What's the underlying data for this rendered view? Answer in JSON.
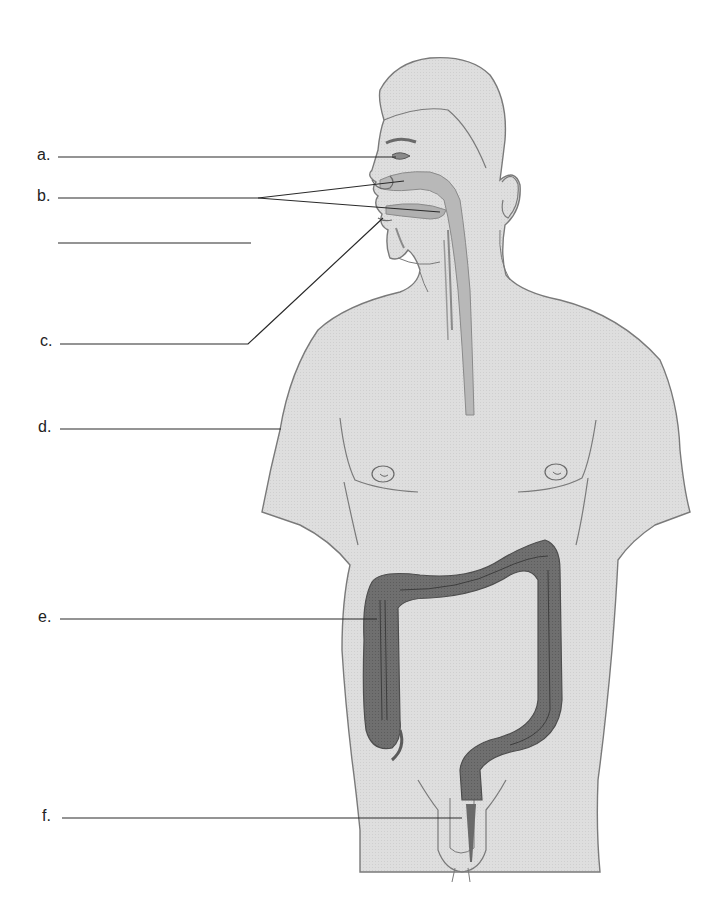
{
  "diagram": {
    "colors": {
      "skin": "#dcdcdc",
      "outline": "#7a7a7a",
      "organ_light": "#b9b9b9",
      "organ_dark": "#6e6e6e",
      "leader_line": "#2a2a2a"
    },
    "labels": [
      {
        "id": "a",
        "text": "a."
      },
      {
        "id": "b",
        "text": "b."
      },
      {
        "id": "blank",
        "text": ""
      },
      {
        "id": "c",
        "text": "c."
      },
      {
        "id": "d",
        "text": "d."
      },
      {
        "id": "e",
        "text": "e."
      },
      {
        "id": "f",
        "text": "f."
      }
    ]
  }
}
